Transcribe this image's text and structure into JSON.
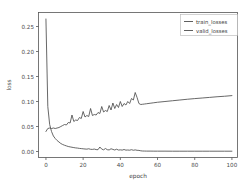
{
  "chart_data": {
    "type": "line",
    "title": "",
    "xlabel": "epoch",
    "ylabel": "loss",
    "xlim": [
      -4,
      103
    ],
    "ylim": [
      -0.012,
      0.278
    ],
    "xticks": [
      "0",
      "20",
      "40",
      "60",
      "80",
      "100"
    ],
    "xtick_values": [
      0,
      20,
      40,
      60,
      80,
      100
    ],
    "yticks": [
      "0.00",
      "0.05",
      "0.10",
      "0.15",
      "0.20",
      "0.25"
    ],
    "ytick_values": [
      0.0,
      0.05,
      0.1,
      0.15,
      0.2,
      0.25
    ],
    "grid": false,
    "legend_position": "upper right",
    "line_color": "#4d4d4d",
    "series": [
      {
        "name": "train_losses",
        "x": [
          0,
          1,
          2,
          3,
          4,
          5,
          6,
          7,
          8,
          9,
          10,
          11,
          12,
          13,
          14,
          15,
          16,
          17,
          18,
          19,
          20,
          21,
          22,
          23,
          24,
          25,
          26,
          27,
          28,
          29,
          30,
          31,
          32,
          33,
          34,
          35,
          36,
          37,
          38,
          39,
          40,
          41,
          42,
          43,
          44,
          45,
          46,
          47,
          48,
          49,
          50,
          51,
          52,
          53,
          54,
          56,
          58,
          60,
          64,
          68,
          72,
          76,
          80,
          84,
          88,
          92,
          96,
          100
        ],
        "values": [
          0.265,
          0.09,
          0.054,
          0.04,
          0.031,
          0.026,
          0.022,
          0.019,
          0.016,
          0.014,
          0.0125,
          0.0112,
          0.01,
          0.0092,
          0.0085,
          0.0078,
          0.0072,
          0.0068,
          0.0062,
          0.0058,
          0.0054,
          0.005,
          0.0047,
          0.0055,
          0.0044,
          0.0042,
          0.0049,
          0.0038,
          0.0036,
          0.009,
          0.0048,
          0.0034,
          0.006,
          0.0036,
          0.0031,
          0.0055,
          0.0042,
          0.003,
          0.0046,
          0.0029,
          0.0033,
          0.0028,
          0.004,
          0.0027,
          0.003,
          0.0026,
          0.0036,
          0.0025,
          0.0032,
          0.0024,
          0.0022,
          0.0014,
          0.001,
          0.0009,
          0.0008,
          0.0008,
          0.0007,
          0.0007,
          0.0007,
          0.0006,
          0.0006,
          0.0006,
          0.0006,
          0.0006,
          0.0006,
          0.0006,
          0.0006,
          0.0006
        ]
      },
      {
        "name": "valid_losses",
        "x": [
          0,
          1,
          2,
          3,
          4,
          5,
          6,
          7,
          8,
          9,
          10,
          11,
          12,
          13,
          14,
          15,
          16,
          17,
          18,
          19,
          20,
          21,
          22,
          23,
          24,
          25,
          26,
          27,
          28,
          29,
          30,
          31,
          32,
          33,
          34,
          35,
          36,
          37,
          38,
          39,
          40,
          41,
          42,
          43,
          44,
          45,
          46,
          47,
          48,
          49,
          50,
          51,
          52,
          53,
          54,
          56,
          58,
          60,
          64,
          68,
          72,
          76,
          80,
          84,
          88,
          92,
          96,
          100
        ],
        "values": [
          0.04,
          0.046,
          0.047,
          0.046,
          0.047,
          0.046,
          0.047,
          0.048,
          0.05,
          0.052,
          0.054,
          0.053,
          0.058,
          0.057,
          0.073,
          0.06,
          0.063,
          0.062,
          0.068,
          0.066,
          0.08,
          0.069,
          0.072,
          0.07,
          0.086,
          0.072,
          0.074,
          0.073,
          0.078,
          0.076,
          0.09,
          0.079,
          0.082,
          0.08,
          0.092,
          0.083,
          0.097,
          0.086,
          0.094,
          0.088,
          0.1,
          0.09,
          0.096,
          0.093,
          0.1,
          0.096,
          0.106,
          0.103,
          0.118,
          0.108,
          0.096,
          0.094,
          0.0945,
          0.095,
          0.0955,
          0.0965,
          0.0975,
          0.0985,
          0.1,
          0.1015,
          0.103,
          0.1045,
          0.1058,
          0.107,
          0.1082,
          0.1095,
          0.1105,
          0.1118
        ]
      }
    ]
  },
  "legend": {
    "entries": [
      {
        "label": "train_losses"
      },
      {
        "label": "valid_losses"
      }
    ]
  }
}
